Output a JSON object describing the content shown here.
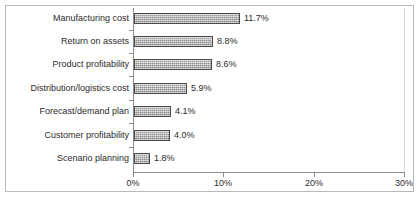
{
  "chart_data": {
    "type": "bar",
    "orientation": "horizontal",
    "title": "",
    "subtitle": "",
    "xlabel": "",
    "ylabel": "",
    "xlim": [
      0,
      30
    ],
    "grid": false,
    "legend": false,
    "legend_position": "none",
    "value_suffix": "%",
    "categories": [
      "Manufacturing cost",
      "Return on assets",
      "Product profitability",
      "Distribution/logistics cost",
      "Forecast/demand plan",
      "Customer profitability",
      "Scenario planning"
    ],
    "values": [
      11.7,
      8.8,
      8.6,
      5.9,
      4.1,
      4.0,
      1.8
    ],
    "data_labels": [
      "11.7%",
      "8.8%",
      "8.6%",
      "5.9%",
      "4.1%",
      "4.0%",
      "1.8%"
    ],
    "xticks": [
      0,
      10,
      20,
      30
    ],
    "xtick_labels": [
      "0%",
      "10%",
      "20%",
      "30%"
    ],
    "colors": {
      "bar_fill": "#9a9a9a",
      "bar_border": "#4a4a4a",
      "axis": "#8c8c8c",
      "text": "#2b2b2b",
      "frame": "#b9b9b9",
      "background": "#ffffff"
    }
  }
}
